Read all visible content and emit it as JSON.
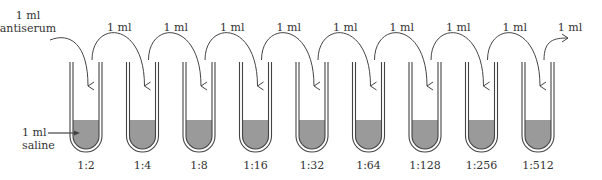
{
  "diagram": {
    "start_label_line1": "1 ml",
    "start_label_line2": "antiserum",
    "saline_label_line1": "1 ml",
    "saline_label_line2": "saline",
    "transfer_label": "1 ml",
    "colors": {
      "liquid": "#9a9a9a",
      "line": "#444444",
      "text": "#333333"
    },
    "tubes": [
      {
        "label": "1:2"
      },
      {
        "label": "1:4"
      },
      {
        "label": "1:8"
      },
      {
        "label": "1:16"
      },
      {
        "label": "1:32"
      },
      {
        "label": "1:64"
      },
      {
        "label": "1:128"
      },
      {
        "label": "1:256"
      },
      {
        "label": "1:512"
      }
    ],
    "transfers": [
      {
        "label": "1 ml"
      },
      {
        "label": "1 ml"
      },
      {
        "label": "1 ml"
      },
      {
        "label": "1 ml"
      },
      {
        "label": "1 ml"
      },
      {
        "label": "1 ml"
      },
      {
        "label": "1 ml"
      },
      {
        "label": "1 ml"
      },
      {
        "label": "1 ml"
      }
    ]
  }
}
